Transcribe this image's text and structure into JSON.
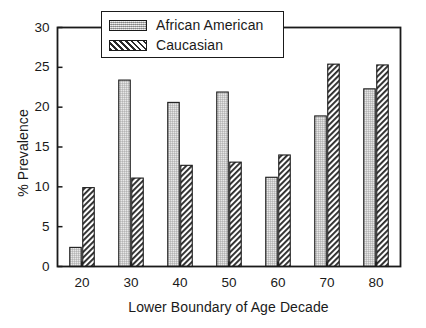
{
  "chart_data": {
    "type": "bar",
    "title": "",
    "xlabel": "Lower Boundary of Age Decade",
    "ylabel": "% Prevalence",
    "categories": [
      "20",
      "30",
      "40",
      "50",
      "60",
      "70",
      "80"
    ],
    "series": [
      {
        "name": "African American",
        "values": [
          2.4,
          23.4,
          20.6,
          21.9,
          11.2,
          18.9,
          22.3
        ]
      },
      {
        "name": "Caucasian",
        "values": [
          9.9,
          11.1,
          12.7,
          13.1,
          14.0,
          25.4,
          25.3
        ]
      }
    ],
    "ylim": [
      0,
      30
    ],
    "yticks": [
      "0",
      "5",
      "10",
      "15",
      "20",
      "25",
      "30"
    ],
    "ytick_values": [
      0,
      5,
      10,
      15,
      20,
      25,
      30
    ],
    "xticks": [
      "20",
      "30",
      "40",
      "50",
      "60",
      "70",
      "80"
    ],
    "grid": false,
    "legend_position": "top-center",
    "colors": {
      "african_american": "#c9c9c9",
      "caucasian": "#2b2b2b",
      "axis": "#1a1a1a",
      "background": "#ffffff"
    }
  },
  "legend": {
    "entries": [
      {
        "label": "African American",
        "pattern": "stipple"
      },
      {
        "label": "Caucasian",
        "pattern": "diagonal-hatch"
      }
    ]
  }
}
